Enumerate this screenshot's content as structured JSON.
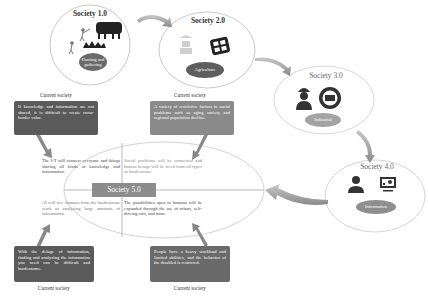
{
  "stages": [
    {
      "id": "society-1",
      "title": "Society 1.0",
      "label": "Hunting and gathering",
      "pill_color": "#6a6a6a"
    },
    {
      "id": "society-2",
      "title": "Society 2.0",
      "label": "Agriculture",
      "pill_color": "#5e5e5e"
    },
    {
      "id": "society-3",
      "title": "Society 3.0",
      "label": "Industrial",
      "pill_color": "#a3a3a3"
    },
    {
      "id": "society-4",
      "title": "Society 4.0",
      "label": "Information",
      "pill_color": "#8f8f8f"
    }
  ],
  "center": {
    "title": "Society 5.0",
    "quadrants": {
      "top_left": "The I-T will connect everyone and things sharing all kinds of knowledge and information.",
      "top_right": "Social problems will be connected and human beings will be freed from all types of burdensome.",
      "bottom_left": "AI will free humans from the burdensome work of analyzing large amounts of information.",
      "bottom_right": "The possibilities open to humans will be expanded through the use of robots, self-driving cars, and more."
    }
  },
  "problems": [
    {
      "position": "top-left",
      "caption": "Current society",
      "text": "If knowledge and information are not shared, it is difficult to create cross-border value.",
      "color": "#5a5a5a"
    },
    {
      "position": "top-right",
      "caption": "Current society",
      "text": "A variety of restrictive factors in social problems such as aging society and regional population decline.",
      "color": "#8a8a8a"
    },
    {
      "position": "bottom-left",
      "caption": "Current society",
      "text": "With the deluge of information, finding and analyzing the information you need can be difficult and burdensome.",
      "color": "#5a5a5a"
    },
    {
      "position": "bottom-right",
      "caption": "Current society",
      "text": "People have a heavy workload and limited abilities, and the behavior of the disabled is restricted.",
      "color": "#6a6a6a"
    }
  ],
  "colors": {
    "ellipse_stroke": "#bbbbbb",
    "arrow_fill": "#9a9a9a",
    "center_label_bg": "#8c8c8c"
  }
}
